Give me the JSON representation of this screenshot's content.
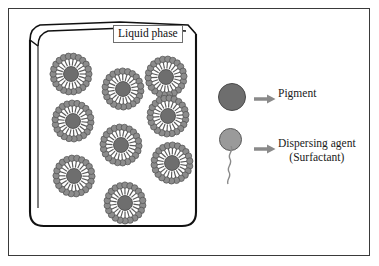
{
  "figure": {
    "title_label": "Liquid phase",
    "background_color": "#ffffff",
    "frame_color": "#3a3a3a"
  },
  "beaker": {
    "name": "beaker-container",
    "outline_color": "#111111",
    "has_pour_spout": true,
    "rounded_bottom": true
  },
  "legend": {
    "items": [
      {
        "icon": "pigment-circle",
        "label": "Pigment",
        "color": "#6e6e6e",
        "arrow": "right-arrow"
      },
      {
        "icon": "surfactant-molecule",
        "label_line1": "Dispersing agent",
        "label_line2": "(Surfactant)",
        "color": "#9a9a9a",
        "arrow": "right-arrow"
      }
    ],
    "arrow_color": "#8a8a8a"
  },
  "micelles": {
    "count": 9,
    "core_color": "#6e6e6e",
    "head_color": "#8c8c8c",
    "tail_color": "#5a5a5a",
    "positions": [
      {
        "x": 51,
        "y": 54
      },
      {
        "x": 103,
        "y": 69
      },
      {
        "x": 146,
        "y": 57
      },
      {
        "x": 53,
        "y": 101
      },
      {
        "x": 148,
        "y": 96
      },
      {
        "x": 101,
        "y": 125
      },
      {
        "x": 152,
        "y": 143
      },
      {
        "x": 54,
        "y": 156
      },
      {
        "x": 105,
        "y": 183
      }
    ],
    "radii": {
      "core": 7.5,
      "tail_inner": 8.5,
      "tail_outer": 15.5,
      "head": 3.2
    },
    "tail_count": 22
  }
}
